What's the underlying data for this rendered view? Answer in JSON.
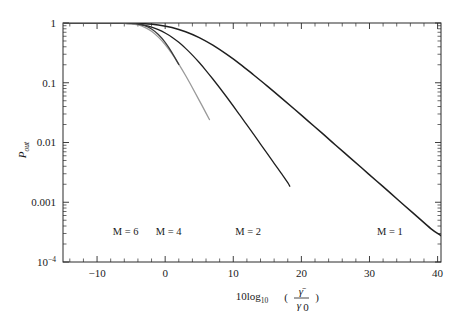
{
  "chart_data": {
    "type": "line",
    "title": "",
    "xlabel": "10log10(gamma_bar / gamma_0)",
    "xlabel_parts": {
      "prefix": "10log",
      "base": "10",
      "open": "(",
      "num": "γ̄",
      "den_sym": "γ",
      "den_sub": "0",
      "close": ")"
    },
    "ylabel": "P_out",
    "ylabel_parts": {
      "main": "P",
      "sub": "out"
    },
    "xlim": [
      -15,
      40.5
    ],
    "ylim": [
      0.0001,
      1
    ],
    "yscale": "log",
    "grid": false,
    "legend": "inline-annotations",
    "xticks": [
      -10,
      0,
      10,
      20,
      30,
      40
    ],
    "xtick_labels": [
      "−10",
      "0",
      "10",
      "20",
      "30",
      "40"
    ],
    "xminor_step": 2,
    "yticks": [
      1,
      0.1,
      0.01,
      0.001,
      0.0001
    ],
    "ytick_labels": [
      "1",
      "0.1",
      "0.01",
      "0.001",
      "10−4"
    ],
    "ytick_label_parts": [
      {
        "main": "1",
        "sup": ""
      },
      {
        "main": "0.1",
        "sup": ""
      },
      {
        "main": "0.01",
        "sup": ""
      },
      {
        "main": "0.001",
        "sup": ""
      },
      {
        "main": "10",
        "sup": "−4"
      }
    ],
    "series": [
      {
        "name": "M = 1",
        "M": 1,
        "color": "#1f1f1f",
        "width": 1.5,
        "label_x": 33.0,
        "label_y": 0.00028,
        "x": [
          -15,
          -13,
          -11,
          -9,
          -7,
          -5,
          -3,
          -1,
          1,
          3,
          5,
          7,
          9,
          11,
          13,
          15,
          17,
          19,
          21,
          23,
          25,
          27,
          29,
          31,
          33,
          35,
          37,
          39,
          40.5
        ],
        "y": [
          1.0,
          1.0,
          0.9999,
          0.9995,
          0.998,
          0.992,
          0.972,
          0.925,
          0.84,
          0.715,
          0.57,
          0.425,
          0.3,
          0.205,
          0.135,
          0.088,
          0.0565,
          0.036,
          0.0228,
          0.0145,
          0.0091,
          0.00575,
          0.00363,
          0.00229,
          0.00145,
          0.00091,
          0.000575,
          0.000363,
          0.000275
        ]
      },
      {
        "name": "M = 2",
        "M": 2,
        "color": "#1f1f1f",
        "width": 1.3,
        "label_x": 12.2,
        "label_y": 0.00028,
        "x": [
          -15,
          -13,
          -11,
          -10,
          -9,
          -8,
          -7,
          -6,
          -5,
          -4,
          -3,
          -2,
          -1,
          0,
          1,
          2,
          3,
          4,
          5,
          6,
          7,
          8,
          9,
          10,
          11,
          12,
          13,
          14,
          15,
          16,
          17,
          18,
          18.3
        ],
        "y": [
          1.0,
          1.0,
          0.9999,
          0.9996,
          0.999,
          0.9975,
          0.994,
          0.987,
          0.973,
          0.949,
          0.909,
          0.851,
          0.774,
          0.68,
          0.578,
          0.474,
          0.376,
          0.29,
          0.218,
          0.16,
          0.1155,
          0.0825,
          0.0583,
          0.0408,
          0.0284,
          0.0197,
          0.01365,
          0.00943,
          0.00651,
          0.00449,
          0.0031,
          0.00213,
          0.00185
        ]
      },
      {
        "name": "M = 4",
        "M": 4,
        "color": "#9a9a9a",
        "width": 1.3,
        "label_x": 0.5,
        "label_y": 0.00028,
        "x": [
          -15,
          -13,
          -12,
          -11,
          -10,
          -9,
          -8,
          -7,
          -6,
          -5,
          -4,
          -3,
          -2,
          -1,
          0,
          1,
          2,
          3,
          4,
          5,
          6,
          6.5
        ],
        "y": [
          1.0,
          1.0,
          1.0,
          0.99998,
          0.99992,
          0.9997,
          0.999,
          0.9966,
          0.9895,
          0.97,
          0.926,
          0.845,
          0.725,
          0.58,
          0.435,
          0.306,
          0.205,
          0.132,
          0.0825,
          0.0508,
          0.031,
          0.0242
        ]
      },
      {
        "name": "M = 6",
        "M": 6,
        "color": "#3a3a3a",
        "width": 1.3,
        "label_x": -5.8,
        "label_y": 0.00028,
        "x": [
          -15,
          -13,
          -12,
          -11,
          -10,
          -9,
          -8,
          -7,
          -6,
          -5,
          -4,
          -3,
          -2,
          -1,
          0,
          1,
          2
        ],
        "y": [
          1.0,
          1.0,
          1.0,
          1.0,
          0.999995,
          0.99997,
          0.99985,
          0.9993,
          0.9968,
          0.9878,
          0.962,
          0.902,
          0.793,
          0.64,
          0.473,
          0.32,
          0.202
        ]
      }
    ]
  },
  "figure": {
    "background": "#ffffff",
    "axis_color": "#2a2a2a",
    "plot_box": {
      "left": 63,
      "top": 23,
      "right": 441,
      "bottom": 262
    }
  }
}
